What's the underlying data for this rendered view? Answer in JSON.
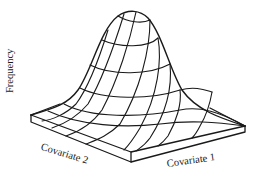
{
  "figure": {
    "type": "3d-surface-diagram",
    "y_axis_label": "Frequency",
    "x_axis_labels": {
      "left": "Covariate 2",
      "right": "Covariate 1"
    },
    "colors": {
      "line": "#1a1a1a",
      "background": "#ffffff"
    }
  }
}
